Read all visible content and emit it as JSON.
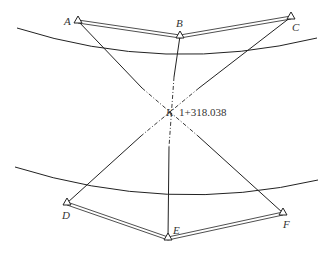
{
  "diagram": {
    "title": "",
    "center": {
      "label": "K",
      "chainage": "1+318.038",
      "x": 170,
      "y": 112
    },
    "points": {
      "A": {
        "label": "A",
        "x": 78,
        "y": 21
      },
      "B": {
        "label": "B",
        "x": 180,
        "y": 36
      },
      "C": {
        "label": "C",
        "x": 291,
        "y": 17
      },
      "D": {
        "label": "D",
        "x": 67,
        "y": 203
      },
      "E": {
        "label": "E",
        "x": 168,
        "y": 238
      },
      "F": {
        "label": "F",
        "x": 283,
        "y": 213
      }
    },
    "labels": {
      "A": "A",
      "B": "B",
      "C": "C",
      "D": "D",
      "E": "E",
      "F": "F",
      "K": "K",
      "chainage": "1+318.038"
    },
    "edges_top": [
      "A-B",
      "B-C"
    ],
    "edges_bottom": [
      "D-E",
      "E-F"
    ],
    "sight_lines": [
      "A-F",
      "B-E",
      "C-D"
    ],
    "line_color": "#222222"
  }
}
